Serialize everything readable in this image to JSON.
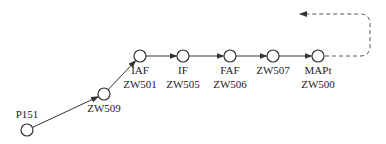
{
  "diagram": {
    "type": "approach-procedure-route",
    "nodes": [
      {
        "id": "P151",
        "labels": [
          "P151"
        ],
        "x": 27,
        "y": 130,
        "label_pos": "above"
      },
      {
        "id": "ZW509",
        "labels": [
          "ZW509"
        ],
        "x": 104,
        "y": 94,
        "label_pos": "below"
      },
      {
        "id": "ZW501",
        "labels": [
          "IAF",
          "ZW501"
        ],
        "x": 140,
        "y": 56,
        "label_pos": "below"
      },
      {
        "id": "ZW505",
        "labels": [
          "IF",
          "ZW505"
        ],
        "x": 183,
        "y": 56,
        "label_pos": "below"
      },
      {
        "id": "ZW506",
        "labels": [
          "FAF",
          "ZW506"
        ],
        "x": 230,
        "y": 56,
        "label_pos": "below"
      },
      {
        "id": "ZW507",
        "labels": [
          "ZW507"
        ],
        "x": 273,
        "y": 56,
        "label_pos": "below"
      },
      {
        "id": "ZW500",
        "labels": [
          "MAPt",
          "ZW500"
        ],
        "x": 318,
        "y": 56,
        "label_pos": "below"
      }
    ],
    "edges": [
      {
        "from": "P151",
        "to": "ZW509",
        "style": "solid"
      },
      {
        "from": "ZW509",
        "to": "ZW501",
        "style": "solid"
      },
      {
        "from": "ZW501",
        "to": "ZW505",
        "style": "solid"
      },
      {
        "from": "ZW505",
        "to": "ZW506",
        "style": "solid"
      },
      {
        "from": "ZW506",
        "to": "ZW507",
        "style": "solid"
      },
      {
        "from": "ZW507",
        "to": "ZW500",
        "style": "solid"
      },
      {
        "from": "ZW500",
        "to": "missed-approach",
        "style": "dashed"
      }
    ],
    "colors": {
      "line": "#333333",
      "node_fill": "#ffffff",
      "text": "#222222"
    }
  }
}
